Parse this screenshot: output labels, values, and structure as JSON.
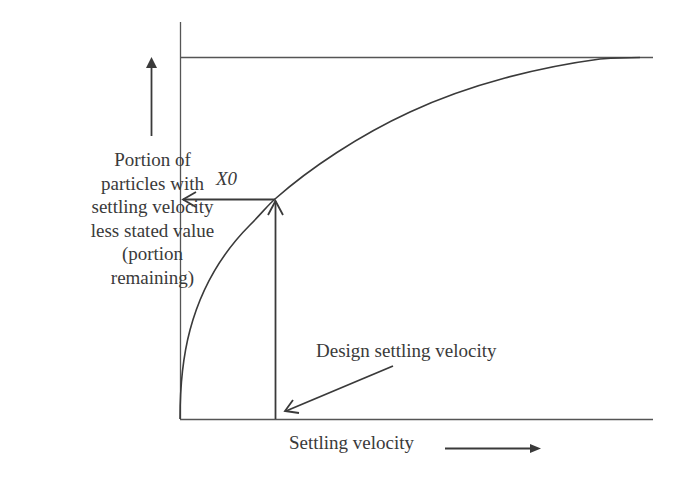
{
  "diagram": {
    "type": "settling-velocity-curve",
    "y_axis_label_lines": [
      "Portion of",
      "particles with",
      "settling velocity",
      "less stated value",
      "(portion",
      "remaining)"
    ],
    "x_axis_label": "Settling velocity",
    "intercept_label": "X0",
    "annotation_label": "Design settling velocity",
    "line_color": "#3a3a3a",
    "curve_color": "#3a3a3a",
    "background": "#ffffff"
  }
}
